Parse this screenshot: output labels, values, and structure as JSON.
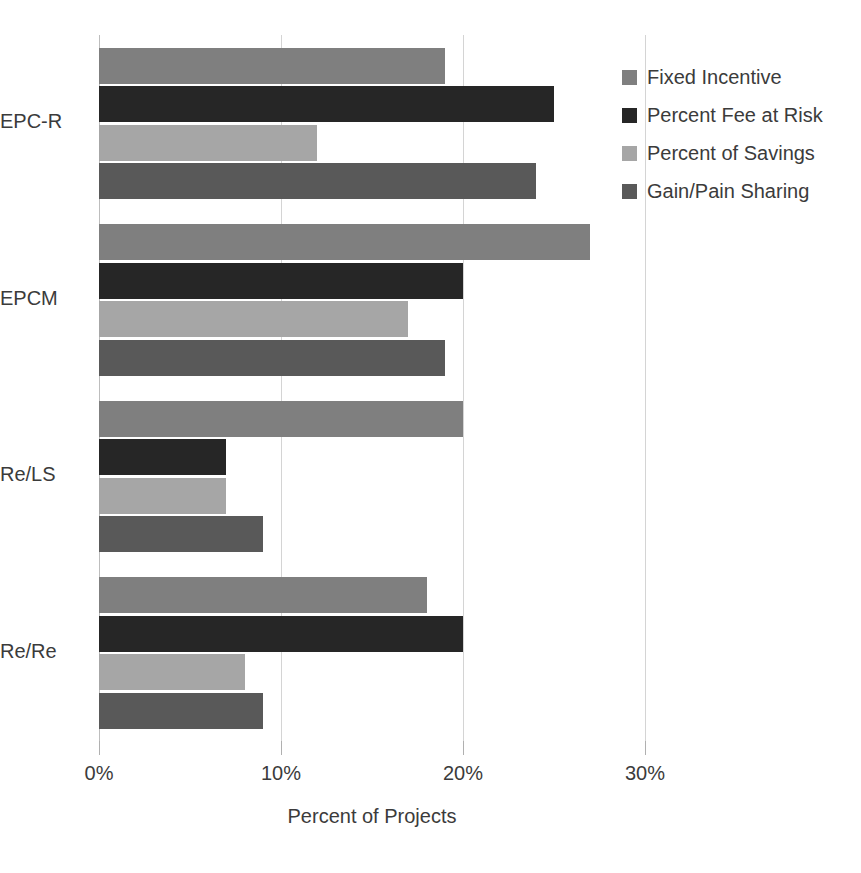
{
  "chart_data": {
    "type": "bar",
    "orientation": "horizontal",
    "title": "",
    "xlabel": "Percent of Projects",
    "ylabel": "",
    "categories": [
      "EPC-R",
      "EPCM",
      "Re/LS",
      "Re/Re"
    ],
    "series": [
      {
        "name": "Fixed Incentive",
        "color": "#7f7f7f",
        "values": [
          19,
          27,
          20,
          18
        ]
      },
      {
        "name": "Percent Fee at Risk",
        "color": "#262626",
        "values": [
          25,
          20,
          7,
          20
        ]
      },
      {
        "name": "Percent of Savings",
        "color": "#a6a6a6",
        "values": [
          12,
          17,
          7,
          8
        ]
      },
      {
        "name": "Gain/Pain Sharing",
        "color": "#595959",
        "values": [
          24,
          19,
          9,
          9
        ]
      }
    ],
    "xlim": [
      0,
      30
    ],
    "xticks": [
      0,
      10,
      20,
      30
    ],
    "xtick_labels": [
      "0%",
      "10%",
      "20%",
      "30%"
    ],
    "grid": "vertical",
    "legend_position": "right"
  },
  "axis": {
    "x_title": "Percent of Projects",
    "tick_labels": [
      "0%",
      "10%",
      "20%",
      "30%"
    ],
    "category_labels": [
      "EPC-R",
      "EPCM",
      "Re/LS",
      "Re/Re"
    ]
  },
  "legend": {
    "items": [
      {
        "label": "Fixed Incentive",
        "color": "#7f7f7f"
      },
      {
        "label": "Percent Fee at Risk",
        "color": "#262626"
      },
      {
        "label": "Percent of Savings",
        "color": "#a6a6a6"
      },
      {
        "label": "Gain/Pain Sharing",
        "color": "#595959"
      }
    ]
  }
}
